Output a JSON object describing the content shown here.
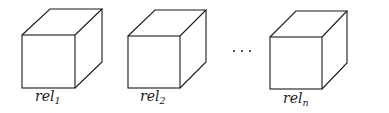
{
  "diagram": {
    "cubes": [
      {
        "label_base": "rel",
        "label_sub": "1"
      },
      {
        "label_base": "rel",
        "label_sub": "2"
      },
      {
        "label_base": "rel",
        "label_sub": "n"
      }
    ],
    "ellipsis": "..."
  }
}
